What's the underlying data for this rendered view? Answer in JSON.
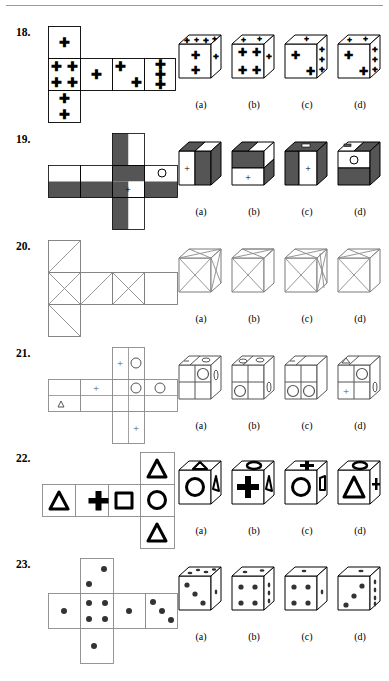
{
  "page": {
    "has_top_rule": true,
    "background": "#ffffff",
    "ink": "#000000",
    "shade": "#555555"
  },
  "option_labels": [
    "(a)",
    "(b)",
    "(c)",
    "(d)"
  ],
  "questions": [
    {
      "number": "18.",
      "number_value": 18,
      "net_type": "cross-plus-row",
      "symbol": "plus-sign",
      "net_faces": [
        {
          "position": "top",
          "marks": 1,
          "desc": "one plus centered"
        },
        {
          "position": "left-row-1",
          "marks": 4,
          "desc": "four plus signs in corners"
        },
        {
          "position": "row-2",
          "marks": 1,
          "desc": "one plus centered"
        },
        {
          "position": "row-3",
          "marks": 2,
          "desc": "two plus signs diagonal"
        },
        {
          "position": "row-4",
          "marks": 3,
          "desc": "three plus signs vertical"
        },
        {
          "position": "bottom",
          "marks": 2,
          "desc": "two plus signs vertical"
        }
      ],
      "options": [
        {
          "label": "(a)",
          "front": 2,
          "top": 4,
          "right": 1
        },
        {
          "label": "(b)",
          "front": 4,
          "top": 2,
          "right": 1
        },
        {
          "label": "(c)",
          "front": 2,
          "top": 1,
          "right": 3
        },
        {
          "label": "(d)",
          "front": 2,
          "top": 3,
          "right": 3
        }
      ]
    },
    {
      "number": "19.",
      "number_value": 19,
      "net_type": "cross",
      "symbol": "half-shaded-with-plus-and-circle",
      "net_faces": [
        {
          "position": "col-top",
          "desc": "left half dark, right half white"
        },
        {
          "position": "row-left",
          "desc": "top white, bottom dark"
        },
        {
          "position": "center",
          "desc": "left dark, center white with plus, right dark"
        },
        {
          "position": "row-right-1",
          "desc": "top white, bottom dark"
        },
        {
          "position": "row-right-2",
          "desc": "top white with circle, bottom dark"
        },
        {
          "position": "col-bottom",
          "desc": "left half dark, right half white"
        }
      ],
      "options": [
        {
          "label": "(a)",
          "front": "white-left-with-plus dark-right",
          "top": "dark-left white-right"
        },
        {
          "label": "(b)",
          "front": "dark-top white-bottom-with-plus",
          "top": "dark-left white-right"
        },
        {
          "label": "(c)",
          "front": "dark-left white-right-with-plus",
          "top": "dark with dash"
        },
        {
          "label": "(d)",
          "front": "white-top-with-circle dark-bottom",
          "top": "white-left dark-right"
        }
      ]
    },
    {
      "number": "20.",
      "number_value": 20,
      "net_type": "cross-plus-row",
      "symbol": "diagonal-lines",
      "net_faces": [
        {
          "position": "top",
          "desc": "single diagonal"
        },
        {
          "position": "left-row-1",
          "desc": "X both diagonals"
        },
        {
          "position": "row-2",
          "desc": "single diagonal"
        },
        {
          "position": "row-3",
          "desc": "X both diagonals"
        },
        {
          "position": "row-4",
          "desc": "blank"
        },
        {
          "position": "bottom",
          "desc": "single diagonal"
        }
      ],
      "options": [
        {
          "label": "(a)",
          "front": "X",
          "top": "X"
        },
        {
          "label": "(b)",
          "front": "X",
          "top": "X"
        },
        {
          "label": "(c)",
          "front": "X",
          "top": "X"
        },
        {
          "label": "(d)",
          "front": "X",
          "top": "X"
        }
      ]
    },
    {
      "number": "21.",
      "number_value": 21,
      "net_type": "cross-split-cells",
      "symbol": "plus-circle-triangle",
      "net_faces": [
        {
          "position": "col-top",
          "desc": "plus left, circle right"
        },
        {
          "position": "row-left-top",
          "desc": "blank"
        },
        {
          "position": "row-left-bottom",
          "desc": "triangle"
        },
        {
          "position": "row-mid",
          "desc": "plus"
        },
        {
          "position": "center-top",
          "desc": "circle"
        },
        {
          "position": "row-right",
          "desc": "circle"
        },
        {
          "position": "col-bottom",
          "desc": "plus"
        }
      ],
      "options": [
        {
          "label": "(a)",
          "front": "circle top-right quadrant",
          "top": "dash and oval"
        },
        {
          "label": "(b)",
          "front": "circle bottom-left",
          "top": "two ovals"
        },
        {
          "label": "(c)",
          "front": "two circles bottom",
          "top": "dash"
        },
        {
          "label": "(d)",
          "front": "plus bottom-left, circle top-right",
          "top": "triangle"
        }
      ]
    },
    {
      "number": "22.",
      "number_value": 22,
      "net_type": "row-with-column",
      "symbol": "triangle-plus-square-circle",
      "net_faces": [
        {
          "position": "row-1",
          "shape": "triangle"
        },
        {
          "position": "row-2",
          "shape": "plus"
        },
        {
          "position": "row-3",
          "shape": "square"
        },
        {
          "position": "row-4",
          "shape": "circle"
        },
        {
          "position": "col-top",
          "shape": "triangle"
        },
        {
          "position": "col-bottom",
          "shape": "triangle"
        }
      ],
      "options": [
        {
          "label": "(a)",
          "front": "circle",
          "top": "triangle",
          "right": "triangle"
        },
        {
          "label": "(b)",
          "front": "plus",
          "top": "circle",
          "right": "triangle"
        },
        {
          "label": "(c)",
          "front": "circle",
          "top": "plus",
          "right": "square"
        },
        {
          "label": "(d)",
          "front": "triangle",
          "top": "circle",
          "right": "plus"
        }
      ]
    },
    {
      "number": "23.",
      "number_value": 23,
      "net_type": "cross-plus-row",
      "symbol": "dots",
      "net_faces": [
        {
          "position": "col-top",
          "dots": 2,
          "desc": "two dots diagonal"
        },
        {
          "position": "row-left",
          "dots": 1,
          "desc": "one dot centered"
        },
        {
          "position": "center",
          "dots": 4,
          "desc": "four dots square"
        },
        {
          "position": "row-mid",
          "dots": 1,
          "desc": "one dot centered"
        },
        {
          "position": "row-right",
          "dots": 3,
          "desc": "three dots diagonal"
        },
        {
          "position": "col-bottom",
          "dots": 1,
          "desc": "one dot centered"
        }
      ],
      "options": [
        {
          "label": "(a)",
          "front": 3,
          "top": 4,
          "right": 1
        },
        {
          "label": "(b)",
          "front": 4,
          "top": 2,
          "right": 3
        },
        {
          "label": "(c)",
          "front": 4,
          "top": 1,
          "right": 1
        },
        {
          "label": "(d)",
          "front": 3,
          "top": 1,
          "right": 4
        }
      ]
    }
  ]
}
